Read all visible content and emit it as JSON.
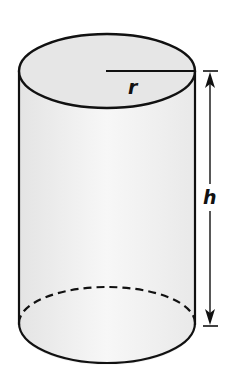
{
  "diagram": {
    "type": "cylinder",
    "labels": {
      "radius": "r",
      "height": "h"
    },
    "colors": {
      "stroke": "#111111",
      "fill_top": "#e6e6e6",
      "fill_body": "#f1f1f1",
      "background": "#ffffff"
    }
  }
}
